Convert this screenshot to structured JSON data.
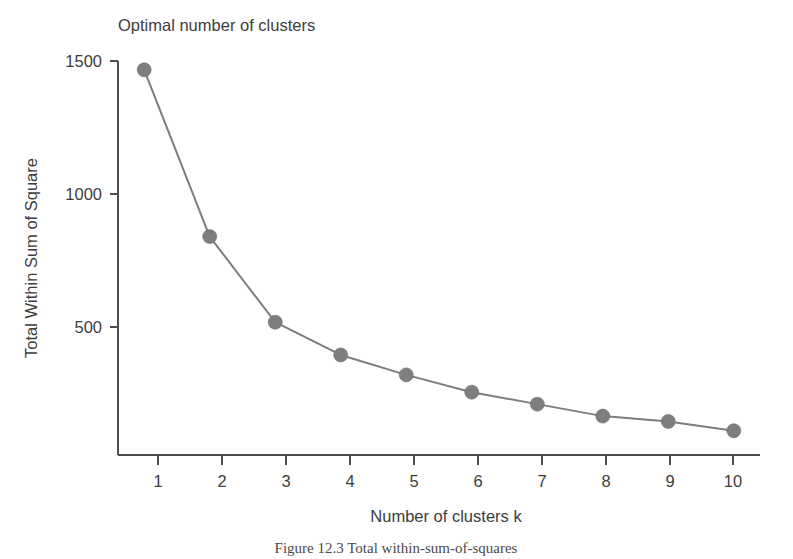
{
  "figure": {
    "background_color": "#ffffff",
    "caption": "Figure 12.3  Total within-sum-of-squares"
  },
  "chart_data": {
    "type": "line",
    "title": "Optimal number of clusters",
    "xlabel": "Number of clusters k",
    "ylabel": "Total Within Sum of Square",
    "x": [
      1,
      2,
      3,
      4,
      5,
      6,
      7,
      8,
      9,
      10
    ],
    "values": [
      1467,
      840,
      518,
      395,
      320,
      255,
      210,
      165,
      145,
      110
    ],
    "series": [
      {
        "name": "Total Within Sum of Square",
        "values": [
          1467,
          840,
          518,
          395,
          320,
          255,
          210,
          165,
          145,
          110
        ]
      }
    ],
    "xtick_labels": [
      "1",
      "2",
      "3",
      "4",
      "5",
      "6",
      "7",
      "8",
      "9",
      "10"
    ],
    "ytick_labels": [
      "500",
      "1000",
      "1500"
    ],
    "ytick_values": [
      500,
      1000,
      1500
    ],
    "xlim": [
      0.6,
      10.4
    ],
    "ylim": [
      0,
      1560
    ],
    "grid": false,
    "legend": false,
    "line_color": "#7d7d7d",
    "marker_color": "#7e7e7e",
    "marker_shape": "circle",
    "axis_color": "#4d4d4d"
  }
}
